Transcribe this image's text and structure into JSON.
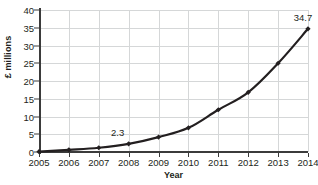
{
  "chart_data": {
    "type": "line",
    "title": "",
    "xlabel": "Year",
    "ylabel": "£ millions",
    "categories": [
      "2005",
      "2006",
      "2007",
      "2008",
      "2009",
      "2010",
      "2011",
      "2012",
      "2013",
      "2014"
    ],
    "values": [
      0.1,
      0.6,
      1.2,
      2.3,
      4.2,
      6.8,
      11.9,
      16.8,
      25.0,
      34.7
    ],
    "series": [
      {
        "name": "Revenue",
        "values": [
          0.1,
          0.6,
          1.2,
          2.3,
          4.2,
          6.8,
          11.9,
          16.8,
          25.0,
          34.7
        ]
      }
    ],
    "ylim": [
      0,
      40
    ],
    "y_ticks": [
      "0",
      "5",
      "10",
      "15",
      "20",
      "25",
      "30",
      "35",
      "40"
    ],
    "y_tick_values": [
      0,
      5,
      10,
      15,
      20,
      25,
      30,
      35,
      40
    ],
    "grid": "horizontal-and-vertical",
    "legend": "none",
    "annotations": [
      {
        "label": "2.3",
        "category": "2008",
        "value": 2.3
      },
      {
        "label": "34.7",
        "category": "2014",
        "value": 34.7
      }
    ],
    "colors": {
      "line": "#231f20",
      "marker": "#231f20",
      "grid": "#d5d7d8",
      "axis": "#3b3b3b",
      "text": "#231f20",
      "background": "#ffffff"
    }
  }
}
